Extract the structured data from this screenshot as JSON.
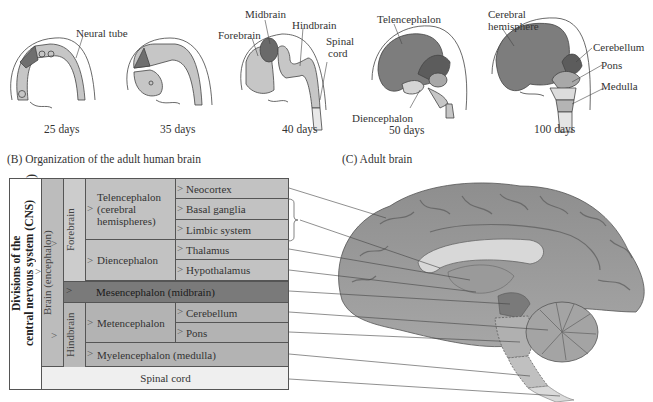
{
  "panelA": {
    "stages": [
      {
        "day": "25 days",
        "labels": [
          "Neural tube"
        ]
      },
      {
        "day": "35 days",
        "labels": []
      },
      {
        "day": "40 days",
        "labels": [
          "Forebrain",
          "Midbrain",
          "Hindbrain",
          "Spinal cord"
        ]
      },
      {
        "day": "50 days",
        "labels": [
          "Telencephalon",
          "Diencephalon"
        ]
      },
      {
        "day": "100 days",
        "labels": [
          "Cerebral hemisphere",
          "Cerebellum",
          "Pons",
          "Medulla"
        ]
      }
    ],
    "label_neural_tube": "Neural tube",
    "label_forebrain": "Forebrain",
    "label_midbrain": "Midbrain",
    "label_hindbrain": "Hindbrain",
    "label_spinal": "Spinal",
    "label_cord": "cord",
    "label_telencephalon": "Telencephalon",
    "label_diencephalon": "Diencephalon",
    "label_cerebral": "Cerebral",
    "label_hemisphere": "hemisphere",
    "label_cerebellum": "Cerebellum",
    "label_pons": "Pons",
    "label_medulla": "Medulla",
    "day_25": "25 days",
    "day_35": "35 days",
    "day_40": "40 days",
    "day_50": "50 days",
    "day_100": "100 days"
  },
  "panelB": {
    "title": "(B)  Organization of the adult human brain",
    "cns_label_line1": "Divisions of the",
    "cns_label_line2": "central nervous system (CNS)",
    "brain_label": "Brain (encephalon)",
    "forebrain_label": "Forebrain",
    "hindbrain_label": "Hindbrain",
    "telencephalon_line1": "Telencephalon",
    "telencephalon_line2": "(cerebral",
    "telencephalon_line3": "hemispheres)",
    "diencephalon": "Diencephalon",
    "mesencephalon": "Mesencephalon (midbrain)",
    "metencephalon": "Metencephalon",
    "myelencephalon": "Myelencephalon (medulla)",
    "spinal_cord": "Spinal cord",
    "structures": {
      "neocortex": "Neocortex",
      "basal_ganglia": "Basal ganglia",
      "limbic_system": "Limbic system",
      "thalamus": "Thalamus",
      "hypothalamus": "Hypothalamus",
      "cerebellum": "Cerebellum",
      "pons": "Pons"
    }
  },
  "panelC": {
    "title": "(C)  Adult brain"
  },
  "colors": {
    "forebrain_light": "#c8c8c8",
    "midbrain_dark": "#6e6e6e",
    "telencephalon_mid": "#8a8a8a",
    "table_light": "#c4c4c4",
    "table_col": "#b4b4b4",
    "mesencephalon": "#7d7d7d",
    "spinal": "#efefef"
  }
}
